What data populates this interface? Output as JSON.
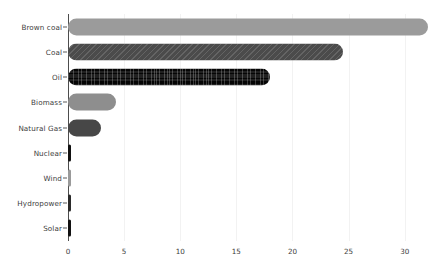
{
  "chart_data": {
    "type": "bar",
    "orientation": "horizontal",
    "title": "",
    "subtitle": "",
    "xlabel": "",
    "ylabel": "",
    "grid": true,
    "legend": false,
    "xlim": [
      0,
      33.5
    ],
    "xticks": [
      "0",
      "5",
      "10",
      "15",
      "20",
      "25",
      "30"
    ],
    "xtick_values": [
      0,
      5,
      10,
      15,
      20,
      25,
      30
    ],
    "categories": [
      "Brown coal",
      "Coal",
      "Oil",
      "Biomass",
      "Natural Gas",
      "Nuclear",
      "Wind",
      "Hydropower",
      "Solar"
    ],
    "values": [
      32.1,
      24.5,
      18.0,
      4.3,
      2.9,
      0.15,
      0.1,
      0.12,
      0.1
    ],
    "bars": [
      {
        "label": "Brown coal",
        "value": 32.1,
        "style": "fill-solid-light",
        "color": "#9b9b9b"
      },
      {
        "label": "Coal",
        "value": 24.5,
        "style": "fill-hatch-dark",
        "color": "#4b4b4b"
      },
      {
        "label": "Oil",
        "value": 18.0,
        "style": "fill-grid-black",
        "color": "#050505"
      },
      {
        "label": "Biomass",
        "value": 4.3,
        "style": "fill-solid-mid",
        "color": "#8e8e8e"
      },
      {
        "label": "Natural Gas",
        "value": 2.9,
        "style": "fill-solid-dark",
        "color": "#474747"
      },
      {
        "label": "Nuclear",
        "value": 0.15,
        "style": "fill-black",
        "color": "#111111"
      },
      {
        "label": "Wind",
        "value": 0.1,
        "style": "fill-gray",
        "color": "#9a9a9a"
      },
      {
        "label": "Hydropower",
        "value": 0.12,
        "style": "fill-dark2",
        "color": "#2b2b2b"
      },
      {
        "label": "Solar",
        "value": 0.1,
        "style": "fill-black",
        "color": "#111111"
      }
    ]
  }
}
